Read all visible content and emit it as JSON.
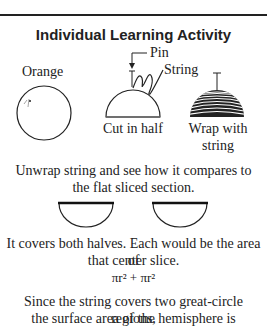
{
  "header": {
    "title": "Individual Learning Activity"
  },
  "diagram": {
    "orange_label": "Orange",
    "pin_label": "Pin",
    "string_label": "String",
    "cut_label": "Cut in half",
    "wrap_label_line1": "Wrap with",
    "wrap_label_line2": "string"
  },
  "body": {
    "unwrap_line1": "Unwrap string and see how it compares to",
    "unwrap_line2": "the flat sliced section.",
    "covers_line1": "It covers both halves. Each would be the area of",
    "covers_line2": "that center slice.",
    "formula": "πr² + πr²",
    "since_line1": "Since the string covers two great-circle regions,",
    "since_line2": "the surface area of the hemisphere is"
  }
}
